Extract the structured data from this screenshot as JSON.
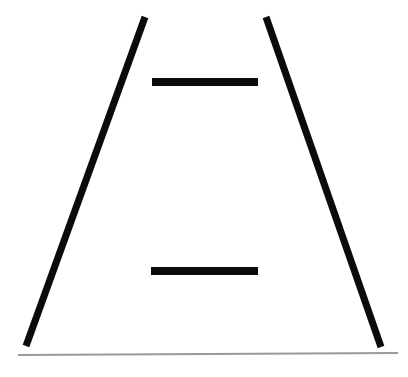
{
  "document": {
    "title": "Line Figure",
    "kind": "line-drawing",
    "background_color": "#ffffff",
    "width": 408,
    "height": 377
  },
  "palette": {
    "ink": "#0b0b0b",
    "baseline_gray": "#9a9a9a",
    "paper": "#ffffff"
  },
  "figure": {
    "strokes": [
      {
        "name": "left-diagonal",
        "color": "#0b0b0b",
        "width": 7,
        "x1": 145,
        "y1": 17,
        "x2": 26,
        "y2": 346
      },
      {
        "name": "right-diagonal",
        "color": "#0b0b0b",
        "width": 7,
        "x1": 266,
        "y1": 17,
        "x2": 381,
        "y2": 347
      },
      {
        "name": "upper-rung",
        "color": "#0b0b0b",
        "width": 8,
        "x1": 152,
        "y1": 82,
        "x2": 258,
        "y2": 82
      },
      {
        "name": "lower-rung",
        "color": "#0b0b0b",
        "width": 8,
        "x1": 151,
        "y1": 271,
        "x2": 258,
        "y2": 271
      },
      {
        "name": "baseline",
        "color": "#9a9a9a",
        "width": 2,
        "x1": 18,
        "y1": 355,
        "x2": 398,
        "y2": 353
      }
    ]
  }
}
